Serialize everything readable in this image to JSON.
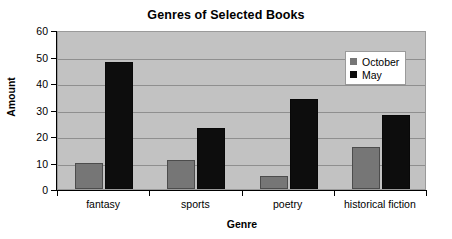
{
  "chart_data": {
    "type": "bar",
    "title": "Genres of Selected Books",
    "xlabel": "Genre",
    "ylabel": "Amount",
    "categories": [
      "fantasy",
      "sports",
      "poetry",
      "historical fiction"
    ],
    "series": [
      {
        "name": "October",
        "color": "#767676",
        "values": [
          10,
          11,
          5,
          16
        ]
      },
      {
        "name": "May",
        "color": "#0d0d0d",
        "values": [
          48,
          23,
          34,
          28
        ]
      }
    ],
    "ylim": [
      0,
      60
    ],
    "ytick_step": 10,
    "yticks": [
      "0",
      "10",
      "20",
      "30",
      "40",
      "50",
      "60"
    ],
    "grid": "horizontal",
    "legend_position": "top-right-inside",
    "plot_background": "#c2c2c2",
    "page_background": "#ffffff"
  }
}
